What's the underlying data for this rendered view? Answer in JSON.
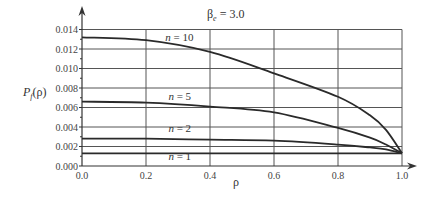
{
  "chart_data": {
    "type": "line",
    "title": "βe = 3.0",
    "title_parts": {
      "symbol": "β",
      "subscript": "e",
      "rest": " = 3.0"
    },
    "xlabel": "ρ",
    "ylabel": "Pf(ρ)",
    "ylabel_parts": {
      "main": "P",
      "subscript": "f",
      "rest": "(ρ)"
    },
    "xlim": [
      0.0,
      1.0
    ],
    "ylim": [
      0.0,
      0.014
    ],
    "grid": true,
    "legend": "inline labels",
    "x_ticks": [
      "0.0",
      "0.2",
      "0.4",
      "0.6",
      "0.8",
      "1.0"
    ],
    "y_ticks": [
      "0.000",
      "0.002",
      "0.004",
      "0.006",
      "0.008",
      "0.010",
      "0.012",
      "0.014"
    ],
    "x": [
      0.0,
      0.2,
      0.4,
      0.6,
      0.8,
      0.9,
      0.95,
      1.0
    ],
    "series": [
      {
        "name": "n = 10",
        "label_prefix": "n",
        "label_value": " = 10",
        "values": [
          0.0132,
          0.0129,
          0.0117,
          0.0095,
          0.0071,
          0.0052,
          0.0037,
          0.0013
        ]
      },
      {
        "name": "n = 5",
        "label_prefix": "n",
        "label_value": " = 5",
        "values": [
          0.0066,
          0.0065,
          0.0061,
          0.0055,
          0.0039,
          0.0029,
          0.0022,
          0.0013
        ]
      },
      {
        "name": "n = 2",
        "label_prefix": "n",
        "label_value": " = 2",
        "values": [
          0.0028,
          0.0028,
          0.0027,
          0.0026,
          0.0022,
          0.0019,
          0.0017,
          0.0013
        ]
      },
      {
        "name": "n = 1",
        "label_prefix": "n",
        "label_value": " = 1",
        "values": [
          0.0013,
          0.0013,
          0.0013,
          0.0013,
          0.0013,
          0.0013,
          0.0013,
          0.0013
        ]
      }
    ],
    "label_positions": [
      {
        "x": 0.26,
        "y": 0.0128
      },
      {
        "x": 0.27,
        "y": 0.0068
      },
      {
        "x": 0.27,
        "y": 0.0035
      },
      {
        "x": 0.27,
        "y": 0.0006
      }
    ]
  }
}
